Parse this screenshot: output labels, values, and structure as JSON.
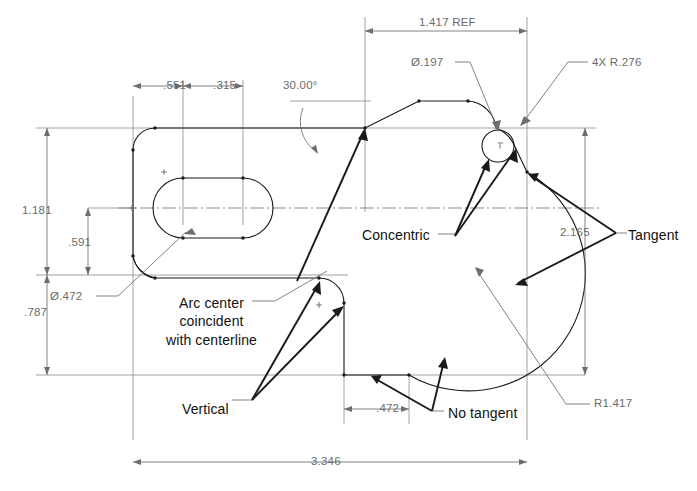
{
  "drawing": {
    "type": "engineering-part-drawing",
    "title": "Sketch constraint / dimension illustration",
    "units": "inches",
    "background_color": "#ffffff",
    "line_color": "#1a1a1a",
    "dimension_color": "#6b6b6b",
    "annotation_color": "#111111"
  },
  "dimensions": [
    {
      "id": "width_551",
      "label": ".551",
      "orientation": "horizontal",
      "x": 163,
      "y": 86
    },
    {
      "id": "width_315",
      "label": ".315",
      "orientation": "horizontal",
      "x": 213,
      "y": 86
    },
    {
      "id": "angle_30",
      "label": "30.00°",
      "orientation": "angular",
      "x": 283,
      "y": 86
    },
    {
      "id": "ref_1417",
      "label": "1.417 REF",
      "orientation": "horizontal",
      "x": 419,
      "y": 23
    },
    {
      "id": "height_1181",
      "label": "1.181",
      "orientation": "vertical",
      "x": 22,
      "y": 205
    },
    {
      "id": "height_591",
      "label": ".591",
      "orientation": "vertical",
      "x": 68,
      "y": 243
    },
    {
      "id": "height_787",
      "label": ".787",
      "orientation": "vertical",
      "x": 24,
      "y": 313
    },
    {
      "id": "height_2165",
      "label": "2.165",
      "orientation": "vertical",
      "x": 560,
      "y": 233
    },
    {
      "id": "width_472",
      "label": ".472",
      "orientation": "horizontal",
      "x": 376,
      "y": 412
    },
    {
      "id": "width_3346",
      "label": "3.346",
      "orientation": "horizontal",
      "x": 331,
      "y": 459
    }
  ],
  "callouts": [
    {
      "id": "dia_197",
      "label": "Ø.197",
      "x": 422,
      "y": 66,
      "kind": "diameter"
    },
    {
      "id": "r276_4x",
      "label": "4X R.276",
      "x": 592,
      "y": 66,
      "kind": "radius"
    },
    {
      "id": "dia_472",
      "label": "Ø.472",
      "x": 58,
      "y": 300,
      "kind": "diameter"
    },
    {
      "id": "r1417",
      "label": "R1.417",
      "x": 594,
      "y": 404,
      "kind": "radius"
    }
  ],
  "notes": [
    {
      "id": "concentric",
      "label": "Concentric",
      "x": 362,
      "y": 230,
      "lines": 1
    },
    {
      "id": "tangent",
      "label": "Tangent",
      "x": 624,
      "y": 230,
      "lines": 1
    },
    {
      "id": "arc_center",
      "label": "Arc center\ncoincident\nwith centerline",
      "x": 166,
      "y": 300,
      "lines": 3
    },
    {
      "id": "vertical",
      "label": "Vertical",
      "x": 182,
      "y": 404,
      "lines": 1
    },
    {
      "id": "no_tangent",
      "label": "No tangent",
      "x": 448,
      "y": 411,
      "lines": 1
    }
  ]
}
